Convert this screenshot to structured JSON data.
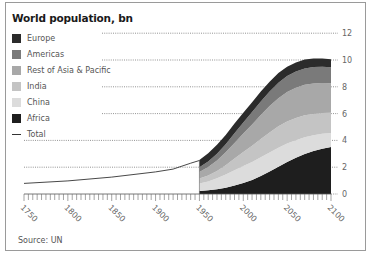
{
  "title": "World population, bn",
  "source": "Source: UN",
  "legend": [
    {
      "label": "Europe",
      "color": "#2b2b2b",
      "type": "area"
    },
    {
      "label": "Americas",
      "color": "#7a7a7a",
      "type": "area"
    },
    {
      "label": "Rest of Asia & Pacific",
      "color": "#a8a8a8",
      "type": "area"
    },
    {
      "label": "India",
      "color": "#c4c4c4",
      "type": "area"
    },
    {
      "label": "China",
      "color": "#dcdcdc",
      "type": "area"
    },
    {
      "label": "Africa",
      "color": "#1e1e1e",
      "type": "area"
    },
    {
      "label": "Total",
      "color": "#333333",
      "type": "line"
    }
  ],
  "chart_data": {
    "type": "area",
    "title": "World population, bn",
    "xlabel": "",
    "ylabel": "",
    "xlim": [
      1750,
      2100
    ],
    "ylim": [
      0,
      12
    ],
    "x_ticks": [
      "1750",
      "1800",
      "1850",
      "1900",
      "1950",
      "2000",
      "2050",
      "2100"
    ],
    "y_ticks": [
      "0",
      "2",
      "4",
      "6",
      "8",
      "10",
      "12"
    ],
    "grid": "dotted horizontal",
    "legend_position": "top-left",
    "stacked_x": [
      1950,
      1960,
      1970,
      1980,
      1990,
      2000,
      2010,
      2020,
      2030,
      2040,
      2050,
      2060,
      2070,
      2080,
      2090,
      2100
    ],
    "series": [
      {
        "name": "Africa",
        "values": [
          0.23,
          0.28,
          0.36,
          0.47,
          0.63,
          0.81,
          1.04,
          1.34,
          1.68,
          2.04,
          2.39,
          2.7,
          2.98,
          3.2,
          3.38,
          3.5
        ]
      },
      {
        "name": "China",
        "values": [
          0.55,
          0.66,
          0.81,
          0.98,
          1.14,
          1.27,
          1.34,
          1.4,
          1.42,
          1.41,
          1.37,
          1.31,
          1.25,
          1.18,
          1.12,
          1.06
        ]
      },
      {
        "name": "India",
        "values": [
          0.37,
          0.45,
          0.55,
          0.7,
          0.87,
          1.05,
          1.22,
          1.37,
          1.5,
          1.6,
          1.65,
          1.66,
          1.64,
          1.6,
          1.55,
          1.5
        ]
      },
      {
        "name": "Rest of Asia & Pacific",
        "values": [
          0.5,
          0.62,
          0.78,
          0.96,
          1.17,
          1.38,
          1.58,
          1.78,
          1.96,
          2.1,
          2.2,
          2.26,
          2.28,
          2.27,
          2.24,
          2.2
        ]
      },
      {
        "name": "Americas",
        "values": [
          0.34,
          0.42,
          0.51,
          0.61,
          0.72,
          0.83,
          0.93,
          1.02,
          1.09,
          1.15,
          1.19,
          1.21,
          1.22,
          1.22,
          1.21,
          1.2
        ]
      },
      {
        "name": "Europe",
        "values": [
          0.55,
          0.61,
          0.66,
          0.69,
          0.72,
          0.73,
          0.74,
          0.74,
          0.73,
          0.72,
          0.7,
          0.68,
          0.66,
          0.64,
          0.62,
          0.6
        ]
      }
    ],
    "total": {
      "name": "Total",
      "x": [
        1750,
        1800,
        1850,
        1900,
        1920,
        1940,
        1950
      ],
      "values": [
        0.79,
        0.98,
        1.26,
        1.65,
        1.86,
        2.3,
        2.5
      ]
    }
  }
}
